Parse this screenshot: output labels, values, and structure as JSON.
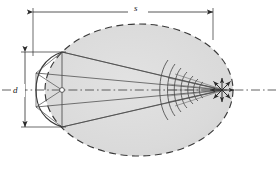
{
  "figure": {
    "background_color": "#ffffff",
    "ink_color": "#3a3a3a",
    "fill_color": "#dcdcdc",
    "dimension_color": "#2b2b2b"
  },
  "labels": {
    "length": "s",
    "diameter": "d"
  },
  "dimensions": {
    "length": {
      "name": "s",
      "orientation": "horizontal",
      "position": "top",
      "arrow_style": "double-headed",
      "x_start": 33,
      "x_end": 213,
      "y": 12
    },
    "diameter": {
      "name": "d",
      "orientation": "vertical",
      "position": "left",
      "arrow_style": "double-headed",
      "y_start": 52,
      "y_end": 127,
      "x": 25
    }
  },
  "ellipse": {
    "name": "field-boundary",
    "center_x": 139,
    "center_y": 90,
    "radius_x": 94,
    "radius_y": 66,
    "stroke_style": "dashed",
    "fill": "#dcdcdc"
  },
  "aperture": {
    "name": "curved-transducer",
    "apex_x": 62,
    "top_y": 52,
    "bottom_y": 127,
    "edge_x": 36,
    "chord_count": 4
  },
  "rays": {
    "count": 6,
    "origin_note": "aperture edge points",
    "converge_x": 222,
    "converge_y": 90
  },
  "wavefronts": {
    "name": "converging-wavefront-arcs",
    "count": 7,
    "x_positions": [
      168,
      174,
      180,
      186,
      192,
      198,
      203
    ]
  },
  "focus": {
    "name": "focal-point",
    "x": 222,
    "y": 90,
    "arrow_directions": 8,
    "arrow_length": 13
  },
  "axis": {
    "name": "center-axis",
    "style": "dash-dot",
    "y": 90,
    "x_start": 2,
    "x_end": 276
  },
  "vertex_marker": {
    "name": "source-point",
    "x": 62,
    "y": 90,
    "radius": 2.4,
    "fill": "#ffffff"
  }
}
